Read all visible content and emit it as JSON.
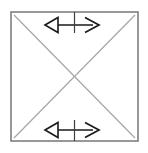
{
  "figure": {
    "background_color": "#ffffff",
    "width": 148,
    "height": 153
  },
  "colors": {
    "square_stroke": "#7f7f7f",
    "diagonal_stroke": "#a6a6a6",
    "arrow_stroke": "#1a1a1a",
    "arrowhead_fill": "#ffffff",
    "tick_stroke": "#404040"
  },
  "square": {
    "name": "square outline",
    "left": 11,
    "top": 12,
    "right": 138,
    "bottom": 141,
    "stroke_width": 1.6
  },
  "diagonals": [
    {
      "name": "diagonal-top-left-to-bottom-right",
      "x1": 14,
      "y1": 15,
      "x2": 135,
      "y2": 138,
      "stroke_width": 1.2
    },
    {
      "name": "diagonal-bottom-left-to-top-right",
      "x1": 14,
      "y1": 138,
      "x2": 135,
      "y2": 15,
      "stroke_width": 1.2
    }
  ],
  "intersection": {
    "name": "diagonal-intersection-point",
    "x": 74.5,
    "y": 76.5
  },
  "arrows": [
    {
      "name": "top-double-arrow",
      "position": "top",
      "shaft_y": 25,
      "shaft_x1": 56,
      "shaft_x2": 93,
      "left_head": {
        "style": "hollow-triangle",
        "tip_x": 45,
        "back_x": 58,
        "half_height": 7.5
      },
      "right_head": {
        "style": "open-chevron",
        "tip_x": 99,
        "back_x": 85,
        "half_height": 7.5
      },
      "tick": {
        "x": 74.5,
        "y1": 12,
        "y2": 33
      }
    },
    {
      "name": "bottom-double-arrow",
      "position": "bottom",
      "shaft_y": 130,
      "shaft_x1": 56,
      "shaft_x2": 93,
      "left_head": {
        "style": "hollow-triangle",
        "tip_x": 45,
        "back_x": 58,
        "half_height": 7.5
      },
      "right_head": {
        "style": "open-chevron",
        "tip_x": 99,
        "back_x": 85,
        "half_height": 7.5
      },
      "tick": {
        "x": 74.5,
        "y1": 120,
        "y2": 141
      }
    }
  ],
  "labels": {
    "figure_caption": "",
    "top_arrow_label": "",
    "bottom_arrow_label": ""
  }
}
